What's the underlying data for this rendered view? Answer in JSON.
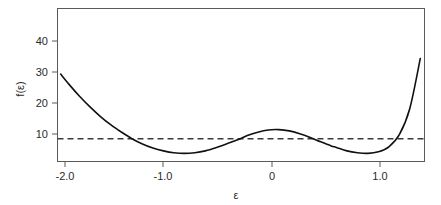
{
  "chart_data": {
    "type": "line",
    "title": "",
    "subtitle": "",
    "xlabel": "ε",
    "ylabel": "f(ε)",
    "xlim": [
      -2.16,
      1.34
    ],
    "ylim": [
      0.5,
      49.5
    ],
    "grid": false,
    "legend": null,
    "xticks": [
      -2.0,
      -1.0,
      0.0,
      1.0
    ],
    "xticklabels": [
      "-2.0",
      "-1.0",
      "0",
      "1.0"
    ],
    "yticks": [
      10,
      20,
      30,
      40
    ],
    "yticklabels": [
      "10",
      "20",
      "30",
      "40"
    ],
    "series": [
      {
        "name": "f(ε)",
        "style": "solid",
        "color": "#111111",
        "x": [
          -2.13,
          -2.05,
          -1.95,
          -1.85,
          -1.75,
          -1.65,
          -1.55,
          -1.45,
          -1.35,
          -1.25,
          -1.15,
          -1.05,
          -0.95,
          -0.85,
          -0.75,
          -0.65,
          -0.55,
          -0.45,
          -0.42,
          -0.35,
          -0.25,
          -0.15,
          -0.05,
          0.05,
          0.15,
          0.25,
          0.35,
          0.45,
          0.5,
          0.6,
          0.7,
          0.8,
          0.9,
          1.0,
          1.1,
          1.2,
          1.3
        ],
        "y": [
          28.5,
          25.2,
          21.4,
          18.0,
          14.9,
          12.2,
          9.9,
          7.8,
          6.1,
          4.8,
          3.9,
          3.3,
          3.1,
          3.3,
          3.9,
          4.9,
          6.1,
          7.4,
          7.7,
          8.8,
          9.9,
          10.6,
          10.7,
          10.3,
          9.4,
          8.2,
          6.8,
          5.5,
          5.0,
          3.9,
          3.3,
          3.1,
          3.6,
          5.2,
          9.1,
          17.5,
          33.5
        ],
        "annotations": [
          {
            "label": "left local minimum",
            "x": -0.95,
            "y": 3.1
          },
          {
            "label": "local maximum",
            "x": -0.05,
            "y": 10.7
          },
          {
            "label": "right local minimum",
            "x": 0.8,
            "y": 3.1
          }
        ]
      },
      {
        "name": "threshold",
        "style": "dashed",
        "color": "#3a3a3a",
        "constant_y": 7.8,
        "x": [
          -2.16,
          1.34
        ],
        "y": [
          7.8,
          7.8
        ]
      }
    ]
  },
  "figure": {
    "background_color": "#ffffff",
    "frame_color": "#5a5a5a",
    "text_color": "#2b2b2b"
  },
  "axis": {
    "x_title": "ε",
    "y_title": "f(ε)",
    "x_tick_labels": [
      "-2.0",
      "-1.0",
      "0",
      "1.0"
    ],
    "y_tick_labels": [
      "10",
      "20",
      "30",
      "40"
    ]
  }
}
